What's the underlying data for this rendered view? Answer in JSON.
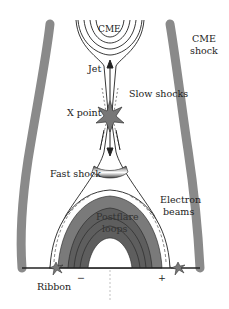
{
  "diagram": {
    "type": "solar flare / CME reconnection schematic",
    "labels": {
      "cme": "CME",
      "cme_shock_line1": "CME",
      "cme_shock_line2": "shock",
      "jet": "Jet",
      "slow_shocks": "Slow shocks",
      "x_point": "X point",
      "fast_shock": "Fast shock",
      "electron_line1": "Electron",
      "electron_line2": "beams",
      "postflare_line1": "Postflare",
      "postflare_line2": "loops",
      "ribbon": "Ribbon",
      "minus": "−",
      "plus": "+"
    },
    "colors": {
      "shock_band": "#8a8a8a",
      "loop_outer": "#7a7a7a",
      "loop_inner": "#5e5e5e",
      "star": "#777777",
      "line": "#222222"
    }
  }
}
